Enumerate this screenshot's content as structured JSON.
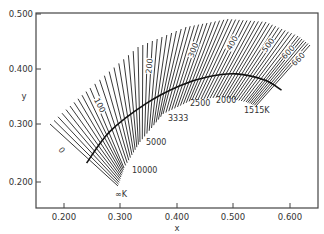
{
  "chart_data": {
    "type": "line",
    "title": "",
    "xlabel": "x",
    "ylabel": "y",
    "xlim": [
      0.15,
      0.65
    ],
    "ylim": [
      0.16,
      0.5
    ],
    "grid": false,
    "x_ticks": [
      "0.200",
      "0.300",
      "0.400",
      "0.500",
      "0.600"
    ],
    "y_ticks": [
      "0.500",
      "0.400",
      "0.300",
      "0.200"
    ],
    "series": [
      {
        "name": "Planckian locus",
        "x": [
          0.24,
          0.281,
          0.345,
          0.405,
          0.455,
          0.505,
          0.555,
          0.585
        ],
        "y": [
          0.234,
          0.29,
          0.34,
          0.372,
          0.388,
          0.393,
          0.382,
          0.364
        ]
      }
    ],
    "isotemperature_lines": {
      "unit": "mired",
      "step": 10,
      "start": 0,
      "end": 660
    },
    "annotations": {
      "mired_labels": [
        "0",
        "100",
        "200",
        "300",
        "400",
        "500",
        "600",
        "660"
      ],
      "temperature_labels": [
        "∞K",
        "10000",
        "5000",
        "3333",
        "2500",
        "2000",
        "1515K"
      ]
    }
  },
  "axes": {
    "x_title": "x",
    "y_title": "y",
    "x_ticks": [
      "0.200",
      "0.300",
      "0.400",
      "0.500",
      "0.600"
    ],
    "y_ticks": [
      "0.500",
      "0.400",
      "0.300",
      "0.200"
    ]
  },
  "labels": {
    "mired": [
      "0",
      "100",
      "200",
      "300",
      "400",
      "500",
      "600",
      "660"
    ],
    "temperature": [
      "∞K",
      "10000",
      "5000",
      "3333",
      "2500",
      "2000",
      "1515K"
    ]
  },
  "colors": {
    "axis": "#333333",
    "lines": "#222222",
    "locus": "#111111",
    "background": "#ffffff"
  }
}
